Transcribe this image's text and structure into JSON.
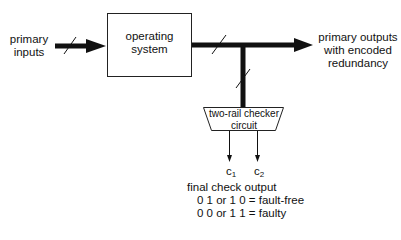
{
  "diagram": {
    "inputs_label": [
      "primary",
      "inputs"
    ],
    "system_box_label": [
      "operating",
      "system"
    ],
    "outputs_label": [
      "primary outputs",
      "with encoded",
      "redundancy"
    ],
    "checker_label": [
      "two-rail checker",
      "circuit"
    ],
    "check_outputs": [
      {
        "base": "c",
        "sub": "1"
      },
      {
        "base": "c",
        "sub": "2"
      }
    ],
    "final_check_title": "final check output",
    "final_check_rules": [
      "0 1 or 1 0 = fault-free",
      "0 0 or 1 1 = faulty"
    ],
    "colors": {
      "line": "#111111",
      "background": "#ffffff"
    }
  }
}
